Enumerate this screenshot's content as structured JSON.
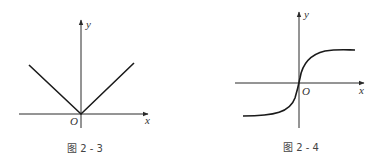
{
  "figures": [
    {
      "id": "fig-2-3",
      "caption": "图 2 - 3",
      "axis_labels": {
        "x": "x",
        "y": "y",
        "origin": "O"
      },
      "description": "V-shaped graph symmetric about the y-axis with vertex at origin (y = |x|)"
    },
    {
      "id": "fig-2-4",
      "caption": "图 2 - 4",
      "axis_labels": {
        "x": "x",
        "y": "y",
        "origin": "O"
      },
      "description": "S-shaped increasing curve through origin with horizontal asymptotes above and below"
    }
  ],
  "colors": {
    "line": "#1a1a1a",
    "axis": "#2a2a2a",
    "text": "#333333"
  }
}
